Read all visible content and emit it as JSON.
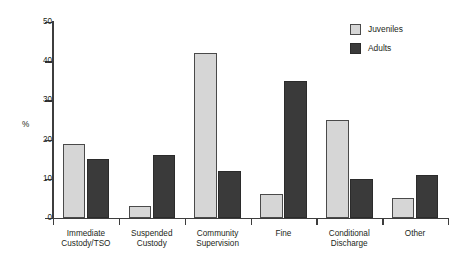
{
  "chart_data": {
    "type": "bar",
    "title": "",
    "xlabel": "",
    "ylabel": "%",
    "ylim": [
      0,
      50
    ],
    "yticks": [
      0,
      10,
      20,
      30,
      40,
      50
    ],
    "ytick_labels": [
      "0",
      "10",
      "20",
      "30",
      "40",
      "50"
    ],
    "grid": false,
    "legend_position": "top-right",
    "categories": [
      "Immediate Custody/TSO",
      "Suspended Custody",
      "Community Supervision",
      "Fine",
      "Conditional Discharge",
      "Other"
    ],
    "category_lines": [
      [
        "Immediate",
        "Custody/TSO"
      ],
      [
        "Suspended",
        "Custody"
      ],
      [
        "Community",
        "Supervision"
      ],
      [
        "Fine"
      ],
      [
        "Conditional",
        "Discharge"
      ],
      [
        "Other"
      ]
    ],
    "series": [
      {
        "name": "Juveniles",
        "color": "#d6d6d6",
        "values": [
          19,
          3,
          42,
          6,
          25,
          5
        ]
      },
      {
        "name": "Adults",
        "color": "#3a3a3a",
        "values": [
          15,
          16,
          12,
          35,
          10,
          11
        ]
      }
    ]
  },
  "legend": {
    "items": [
      {
        "label": "Juveniles",
        "swatch": "juveniles"
      },
      {
        "label": "Adults",
        "swatch": "adults"
      }
    ]
  },
  "axes": {
    "y_title": "%"
  }
}
